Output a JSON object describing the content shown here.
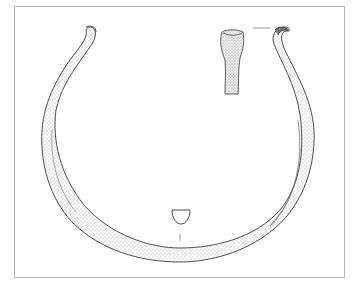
{
  "figure": {
    "views": [
      {
        "name": "main-view",
        "description": "ring in plan view"
      },
      {
        "name": "terminal-detail",
        "description": "side view of terminal end"
      },
      {
        "name": "cross-section",
        "description": "D-shaped section"
      }
    ]
  },
  "colors": {
    "border": "#b4b4b4",
    "ink": "#3a3a3a",
    "stipple": "#6e6e6e",
    "background": "#ffffff"
  }
}
